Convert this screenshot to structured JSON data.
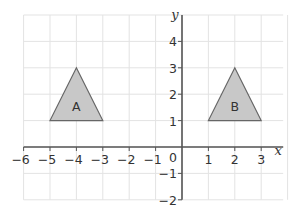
{
  "diagram": {
    "type": "coordinate-grid",
    "x_axis": {
      "label": "x",
      "min": -6,
      "max": 3,
      "ticks": [
        "-6",
        "-5",
        "-4",
        "-3",
        "-2",
        "-1",
        "1",
        "2",
        "3"
      ]
    },
    "y_axis": {
      "label": "y",
      "min": -2,
      "max": 5,
      "ticks": [
        "4",
        "3",
        "2",
        "1",
        "-1",
        "-2"
      ]
    },
    "origin_label": "0",
    "shapes": [
      {
        "label": "A",
        "vertices": [
          [
            -5,
            1
          ],
          [
            -3,
            1
          ],
          [
            -4,
            3
          ]
        ],
        "fill": "#c8c8c8",
        "stroke": "#666666"
      },
      {
        "label": "B",
        "vertices": [
          [
            1,
            1
          ],
          [
            3,
            1
          ],
          [
            2,
            3
          ]
        ],
        "fill": "#c8c8c8",
        "stroke": "#666666"
      }
    ],
    "colors": {
      "grid": "#e3e3e3",
      "axis": "#555555"
    }
  }
}
